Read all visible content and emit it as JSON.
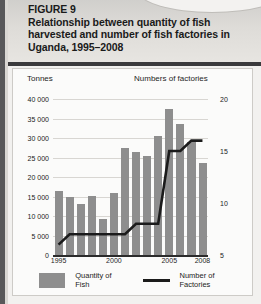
{
  "figure": {
    "number_label": "FIGURE 9",
    "title": "Relationship between quantity of fish harvested and number of fish factories in Uganda, 1995–2008"
  },
  "chart_data": {
    "type": "bar",
    "title": "Relationship between quantity of fish harvested and number of fish factories in Uganda, 1995–2008",
    "xlabel": "",
    "ylabel": "Tonnes",
    "y2label": "Numbers of factories",
    "ylim": [
      0,
      40000
    ],
    "y2lim": [
      5,
      20
    ],
    "grid": true,
    "legend_position": "bottom",
    "categories": [
      "1995",
      "1996",
      "1997",
      "1998",
      "1999",
      "2000",
      "2001",
      "2002",
      "2003",
      "2004",
      "2005",
      "2006",
      "2007",
      "2008"
    ],
    "x_tick_labels": [
      "1995",
      "2000",
      "2005",
      "2008"
    ],
    "y_tick_labels": [
      "0",
      "5 000",
      "10 000",
      "15 000",
      "20 000",
      "25 000",
      "30 000",
      "35 000",
      "40 000"
    ],
    "y_ticks": [
      0,
      5000,
      10000,
      15000,
      20000,
      25000,
      30000,
      35000,
      40000
    ],
    "y2_tick_labels": [
      "5",
      "10",
      "15",
      "20"
    ],
    "y2_ticks": [
      5,
      10,
      15,
      20
    ],
    "series": [
      {
        "name": "Quantity of Fish",
        "type": "bar",
        "axis": "left",
        "unit": "tonnes",
        "color": "#8e8e8e",
        "values": [
          16500,
          15000,
          13200,
          15100,
          9300,
          16000,
          27500,
          26500,
          25500,
          30500,
          37500,
          33500,
          29000,
          23500
        ]
      },
      {
        "name": "Number of Factories",
        "type": "line",
        "axis": "right",
        "unit": "factories",
        "color": "#1b1b1b",
        "values": [
          6,
          7,
          7,
          7,
          7,
          7,
          7,
          8,
          8,
          8,
          15,
          15,
          16,
          16
        ]
      }
    ]
  },
  "legend": {
    "items": [
      {
        "label": "Quantity of Fish",
        "marker": "bar-swatch"
      },
      {
        "label": "Number of Factories",
        "marker": "line-swatch"
      }
    ]
  },
  "colors": {
    "bar": "#8e8e8e",
    "line": "#1b1b1b",
    "grid": "#d8d6d2",
    "header_band": "#dedcd8",
    "panel_background": "#fbfbfa"
  }
}
